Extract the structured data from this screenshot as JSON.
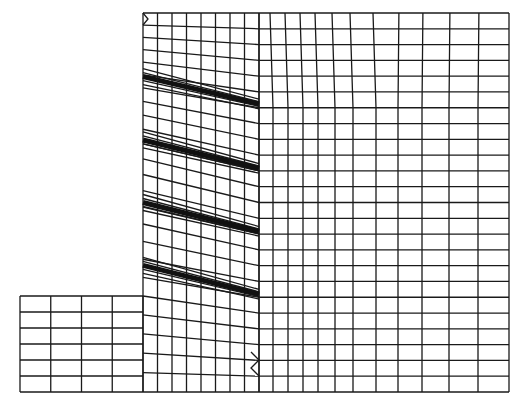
{
  "diagram": {
    "line_color": "#1a1a1a",
    "nail_color": "#111111",
    "background": "#ffffff",
    "regions": {
      "front_berm": {
        "columns": 4,
        "rows": 6,
        "label": "front soil block"
      },
      "reinforced_zone": {
        "columns": 8,
        "rows": 24,
        "label": "nailed soil zone"
      },
      "retained_soil": {
        "columns": 12,
        "rows": 24,
        "label": "retained soil"
      }
    },
    "nails": [
      {
        "name": "nail-1",
        "depth_fraction_start": 0.168,
        "depth_fraction_end": 0.24
      },
      {
        "name": "nail-2",
        "depth_fraction_start": 0.335,
        "depth_fraction_end": 0.41
      },
      {
        "name": "nail-3",
        "depth_fraction_start": 0.5,
        "depth_fraction_end": 0.576
      },
      {
        "name": "nail-4",
        "depth_fraction_start": 0.666,
        "depth_fraction_end": 0.742
      }
    ]
  }
}
